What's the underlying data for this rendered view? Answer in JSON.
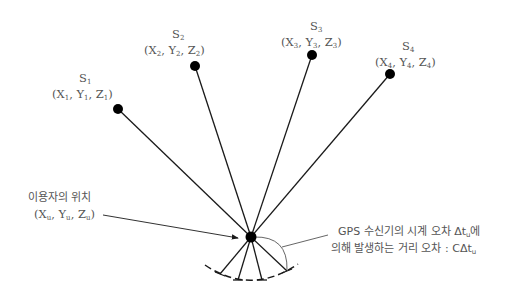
{
  "diagram": {
    "colors": {
      "line": "#1a1a1a",
      "text": "#555555",
      "dot": "#000000",
      "background": "#ffffff"
    },
    "satellites": [
      {
        "name": "S",
        "index": "1",
        "coord": [
          "X",
          "Y",
          "Z"
        ],
        "sub": "1",
        "x": 118,
        "y": 109
      },
      {
        "name": "S",
        "index": "2",
        "coord": [
          "X",
          "Y",
          "Z"
        ],
        "sub": "2",
        "x": 195,
        "y": 66
      },
      {
        "name": "S",
        "index": "3",
        "coord": [
          "X",
          "Y",
          "Z"
        ],
        "sub": "3",
        "x": 312,
        "y": 55
      },
      {
        "name": "S",
        "index": "4",
        "coord": [
          "X",
          "Y",
          "Z"
        ],
        "sub": "4",
        "x": 390,
        "y": 74
      }
    ],
    "user": {
      "label": "이용자의 위치",
      "coord": [
        "X",
        "Y",
        "Z"
      ],
      "sub": "u",
      "x": 251,
      "y": 237
    },
    "error_note": {
      "line1_prefix": "GPS 수신기의 시계 오차 ",
      "line1_symbol": "Δt",
      "line1_sub": "u",
      "line1_suffix": "에",
      "line2_prefix": "의해 발생하는 거리 오차 : ",
      "line2_symbol": "CΔt",
      "line2_sub": "u"
    }
  }
}
